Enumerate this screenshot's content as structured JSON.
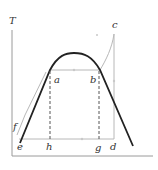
{
  "diagram": {
    "type": "T-s diagram",
    "axis": {
      "y_label": "T",
      "x_label": ""
    },
    "points": {
      "a": "a",
      "b": "b",
      "c": "c",
      "d": "d",
      "e": "e",
      "f": "f",
      "g": "g",
      "h": "h"
    },
    "colors": {
      "dome": "#222222",
      "cycle": "#b8b8b8",
      "axis": "#9a9a9a",
      "dashed": "#555555",
      "label": "#333333"
    }
  }
}
